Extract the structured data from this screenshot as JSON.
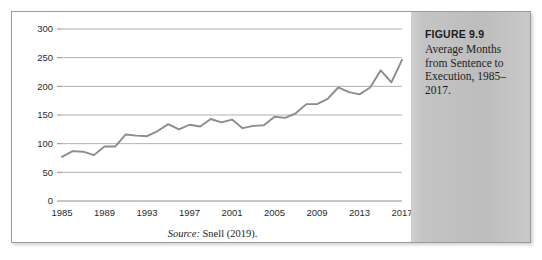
{
  "figure": {
    "caption_title": "FIGURE 9.9",
    "caption_body": "Average Months from Sentence to Execution, 1985–2017.",
    "source_label": "Source:",
    "source_text": " Snell (2019)."
  },
  "colors": {
    "line": "#8c8c8c",
    "gridline": "#a8a8a8",
    "panel_background": "#c4c4c4",
    "border": "#9a9a9a",
    "text": "#1d1d1d"
  },
  "chart_data": {
    "type": "line",
    "title": "Average Months from Sentence to Execution, 1985–2017",
    "xlabel": "",
    "ylabel": "",
    "ylim": [
      0,
      300
    ],
    "xlim": [
      1985,
      2017
    ],
    "ytick_values": [
      0,
      50,
      100,
      150,
      200,
      250,
      300
    ],
    "ytick_labels": [
      "0",
      "50",
      "100",
      "150",
      "200",
      "250",
      "300"
    ],
    "xtick_values": [
      1985,
      1989,
      1993,
      1997,
      2001,
      2005,
      2009,
      2013,
      2017
    ],
    "xtick_labels": [
      "1985",
      "1989",
      "1993",
      "1997",
      "2001",
      "2005",
      "2009",
      "2013",
      "2017"
    ],
    "grid": true,
    "legend": false,
    "units": "months",
    "x": [
      1985,
      1986,
      1987,
      1988,
      1989,
      1990,
      1991,
      1992,
      1993,
      1994,
      1995,
      1996,
      1997,
      1998,
      1999,
      2000,
      2001,
      2002,
      2003,
      2004,
      2005,
      2006,
      2007,
      2008,
      2009,
      2010,
      2011,
      2012,
      2013,
      2014,
      2015,
      2016,
      2017
    ],
    "y": [
      77,
      87,
      86,
      80,
      95,
      95,
      116,
      114,
      113,
      122,
      134,
      125,
      133,
      130,
      143,
      137,
      142,
      127,
      131,
      132,
      147,
      145,
      153,
      169,
      169,
      178,
      198,
      190,
      186,
      198,
      228,
      207,
      246
    ],
    "series": [
      {
        "name": "Average months from sentence to execution",
        "values": [
          77,
          87,
          86,
          80,
          95,
          95,
          116,
          114,
          113,
          122,
          134,
          125,
          133,
          130,
          143,
          137,
          142,
          127,
          131,
          132,
          147,
          145,
          153,
          169,
          169,
          178,
          198,
          190,
          186,
          198,
          228,
          207,
          246
        ]
      }
    ]
  }
}
